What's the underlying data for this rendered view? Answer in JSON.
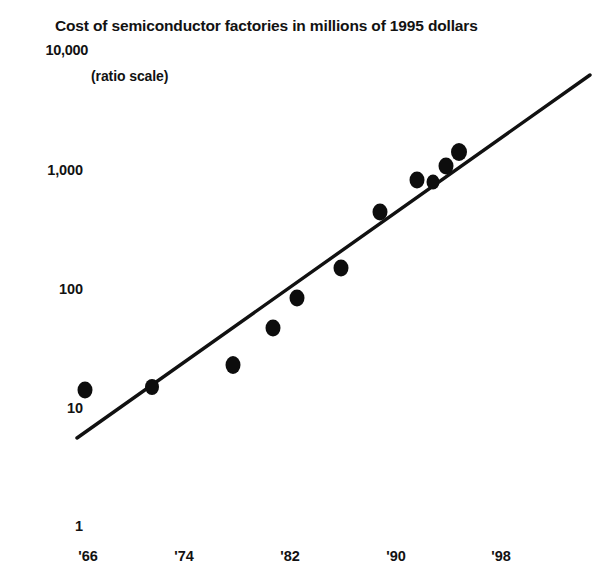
{
  "chart_data": {
    "type": "scatter",
    "title": "Cost of semiconductor factories in millions of 1995 dollars",
    "subtitle": "(ratio scale)",
    "xlabel": "",
    "ylabel": "",
    "scale": "log",
    "grid": false,
    "legend": "none",
    "ylim": [
      1,
      10000
    ],
    "xlim": [
      1964,
      2000
    ],
    "ytick_labels": [
      "10,000",
      "1,000",
      "100",
      "10",
      "1"
    ],
    "ytick_values": [
      10000,
      1000,
      100,
      10,
      1
    ],
    "xtick_labels": [
      "'66",
      "'74",
      "'82",
      "'90",
      "'98"
    ],
    "xtick_values": [
      1966,
      1974,
      1982,
      1990,
      1998
    ],
    "x": [
      1966,
      1971,
      1977,
      1980,
      1982,
      1986,
      1989,
      1992,
      1993,
      1994,
      1995
    ],
    "values": [
      14,
      15,
      23,
      50,
      85,
      150,
      400,
      800,
      780,
      1000,
      1300
    ],
    "series": [
      {
        "name": "Cost of semiconductor factories",
        "x": [
          1966,
          1971,
          1977,
          1980,
          1982,
          1986,
          1989,
          1992,
          1993,
          1994,
          1995
        ],
        "values": [
          14,
          15,
          23,
          50,
          85,
          150,
          400,
          800,
          780,
          1000,
          1300
        ]
      }
    ],
    "trendline": {
      "type": "linear-on-log",
      "x_start": 1965.0,
      "y_start": 5.2,
      "x_end": 1999.0,
      "y_end": 3200
    },
    "annotations": []
  },
  "axes": {
    "y_ticks": [
      {
        "label": "10,000",
        "value": 10000,
        "px_y": 50,
        "px_right": 88
      },
      {
        "label": "1,000",
        "value": 1000,
        "px_y": 170,
        "px_right": 83
      },
      {
        "label": "100",
        "value": 100,
        "px_y": 289,
        "px_right": 83
      },
      {
        "label": "10",
        "value": 10,
        "px_y": 408,
        "px_right": 83
      },
      {
        "label": "1",
        "value": 1,
        "px_y": 526,
        "px_right": 83
      }
    ],
    "x_ticks": [
      {
        "label": "'66",
        "value": 1966,
        "px_x": 88
      },
      {
        "label": "'74",
        "value": 1974,
        "px_x": 184
      },
      {
        "label": "'82",
        "value": 1982,
        "px_x": 290
      },
      {
        "label": "'90",
        "value": 1990,
        "px_x": 396
      },
      {
        "label": "'98",
        "value": 1998,
        "px_x": 501
      }
    ]
  },
  "points_px": [
    {
      "cx": 85,
      "cy": 390,
      "rx": 7.5,
      "ry": 8.5
    },
    {
      "cx": 152,
      "cy": 387,
      "rx": 7.0,
      "ry": 8.0
    },
    {
      "cx": 233,
      "cy": 365,
      "rx": 7.5,
      "ry": 9.0
    },
    {
      "cx": 273,
      "cy": 328,
      "rx": 7.5,
      "ry": 8.5
    },
    {
      "cx": 297,
      "cy": 298,
      "rx": 7.5,
      "ry": 8.5
    },
    {
      "cx": 341,
      "cy": 268,
      "rx": 7.5,
      "ry": 8.5
    },
    {
      "cx": 380,
      "cy": 212,
      "rx": 7.5,
      "ry": 8.5
    },
    {
      "cx": 417,
      "cy": 180,
      "rx": 7.5,
      "ry": 8.5
    },
    {
      "cx": 433,
      "cy": 182,
      "rx": 6.5,
      "ry": 7.5
    },
    {
      "cx": 446,
      "cy": 166,
      "rx": 7.5,
      "ry": 8.5
    },
    {
      "cx": 459,
      "cy": 152,
      "rx": 8.0,
      "ry": 9.0
    }
  ],
  "trendline_px": {
    "x1": 77,
    "y1": 438,
    "x2": 590,
    "y2": 75
  },
  "colors": {
    "ink": "#111111",
    "point_fill": "#0d0d0d",
    "background": "#ffffff"
  }
}
